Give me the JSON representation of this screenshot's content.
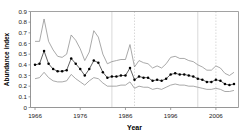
{
  "chart_data": {
    "type": "line",
    "title": "",
    "xlabel": "Year",
    "ylabel": "Abundance index",
    "xlim": [
      1965,
      2011
    ],
    "ylim": [
      0,
      0.9
    ],
    "yticks": [
      0,
      0.1,
      0.2,
      0.3,
      0.4,
      0.5,
      0.6,
      0.7,
      0.8,
      0.9
    ],
    "ytick_labels": [
      "0",
      "0.1",
      "0.2",
      "0.3",
      "0.4",
      "0.5",
      "0.6",
      "0.7",
      "0.8",
      "0.9"
    ],
    "xticks": [
      1966,
      1976,
      1986,
      1996,
      2006
    ],
    "xtick_labels": [
      "1966",
      "1976",
      "1986",
      "1996",
      "2006"
    ],
    "grid": "vertical-reference-lines",
    "vertical_reference_lines": [
      1983,
      1988,
      2002,
      2006
    ],
    "legend": "none",
    "marker": "filled-circle",
    "x": [
      1966,
      1967,
      1968,
      1969,
      1970,
      1971,
      1972,
      1973,
      1974,
      1975,
      1976,
      1977,
      1978,
      1979,
      1980,
      1981,
      1982,
      1983,
      1984,
      1985,
      1986,
      1987,
      1988,
      1989,
      1990,
      1991,
      1992,
      1993,
      1994,
      1995,
      1996,
      1997,
      1998,
      1999,
      2000,
      2001,
      2002,
      2003,
      2004,
      2005,
      2006,
      2007,
      2008,
      2009,
      2010
    ],
    "series": [
      {
        "name": "Abundance index (mean)",
        "values": [
          0.4,
          0.41,
          0.53,
          0.41,
          0.36,
          0.34,
          0.34,
          0.35,
          0.46,
          0.41,
          0.36,
          0.3,
          0.36,
          0.44,
          0.42,
          0.33,
          0.28,
          0.29,
          0.29,
          0.3,
          0.3,
          0.37,
          0.26,
          0.29,
          0.28,
          0.28,
          0.25,
          0.26,
          0.25,
          0.27,
          0.31,
          0.32,
          0.31,
          0.31,
          0.3,
          0.29,
          0.27,
          0.26,
          0.24,
          0.24,
          0.26,
          0.25,
          0.22,
          0.21,
          0.22
        ]
      },
      {
        "name": "Upper confidence limit",
        "values": [
          0.62,
          0.62,
          0.83,
          0.62,
          0.54,
          0.48,
          0.47,
          0.5,
          0.68,
          0.63,
          0.55,
          0.44,
          0.52,
          0.72,
          0.66,
          0.5,
          0.41,
          0.43,
          0.44,
          0.45,
          0.45,
          0.59,
          0.38,
          0.44,
          0.42,
          0.41,
          0.37,
          0.39,
          0.37,
          0.41,
          0.47,
          0.48,
          0.46,
          0.46,
          0.44,
          0.43,
          0.4,
          0.38,
          0.35,
          0.35,
          0.39,
          0.37,
          0.32,
          0.3,
          0.33
        ]
      },
      {
        "name": "Lower confidence limit",
        "values": [
          0.27,
          0.28,
          0.33,
          0.28,
          0.25,
          0.24,
          0.24,
          0.25,
          0.31,
          0.27,
          0.24,
          0.21,
          0.25,
          0.28,
          0.27,
          0.23,
          0.2,
          0.2,
          0.2,
          0.21,
          0.21,
          0.24,
          0.18,
          0.2,
          0.19,
          0.19,
          0.17,
          0.18,
          0.17,
          0.19,
          0.21,
          0.22,
          0.21,
          0.21,
          0.2,
          0.2,
          0.19,
          0.18,
          0.17,
          0.17,
          0.18,
          0.17,
          0.15,
          0.15,
          0.16
        ]
      }
    ],
    "colors": {
      "mean_line": "#3a3a3a",
      "ci_line": "#8c8c8c",
      "marker": "#000000",
      "axis": "#8a8a8a",
      "gridline": "#c8c8c8",
      "background": "#ffffff"
    }
  }
}
